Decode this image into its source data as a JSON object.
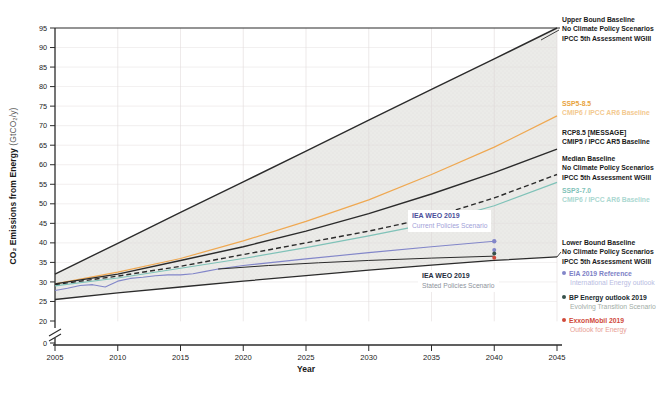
{
  "labels": {
    "ylabel_main": "CO₂ Emissions from Energy ",
    "ylabel_unit": "(GtCO₂/y)",
    "xlabel": "Year"
  },
  "chart_data": {
    "type": "line",
    "title": "",
    "xlabel": "Year",
    "ylabel": "CO2 Emissions from Energy (GtCO2/y)",
    "xlim": [
      2005,
      2045
    ],
    "ylim": [
      20,
      95
    ],
    "axis_break_to_zero": true,
    "x_ticks": [
      2005,
      2010,
      2015,
      2020,
      2025,
      2030,
      2035,
      2040,
      2045
    ],
    "y_ticks": [
      0,
      20,
      25,
      30,
      35,
      40,
      45,
      50,
      55,
      60,
      65,
      70,
      75,
      80,
      85,
      90,
      95
    ],
    "grid": true,
    "shaded_band": {
      "between": [
        "upper-bound-baseline",
        "lower-bound-baseline"
      ],
      "color": "#ebebe8"
    },
    "series": [
      {
        "id": "upper-bound-baseline",
        "color": "#2b2b2b",
        "width": 1.4,
        "x": [
          2005,
          2010,
          2015,
          2020,
          2025,
          2030,
          2035,
          2040,
          2045
        ],
        "values": [
          32,
          39.9,
          47.8,
          55.6,
          63.5,
          71.4,
          79.3,
          87.1,
          95
        ]
      },
      {
        "id": "ssp5-8.5",
        "color": "#efa851",
        "width": 1.2,
        "x": [
          2005,
          2010,
          2015,
          2020,
          2025,
          2030,
          2035,
          2040,
          2045
        ],
        "values": [
          29.5,
          32.5,
          36,
          40.5,
          45.5,
          51,
          57.5,
          64.5,
          72.5
        ]
      },
      {
        "id": "rcp8.5-message",
        "color": "#2b2b2b",
        "width": 1.4,
        "x": [
          2005,
          2010,
          2015,
          2020,
          2025,
          2030,
          2035,
          2040,
          2045
        ],
        "values": [
          29.5,
          32,
          35.5,
          39,
          43,
          47.5,
          52.5,
          58,
          64
        ]
      },
      {
        "id": "median-baseline",
        "color": "#2b2b2b",
        "width": 1.4,
        "dash": "5 3",
        "x": [
          2005,
          2010,
          2015,
          2020,
          2025,
          2030,
          2035,
          2040,
          2045
        ],
        "values": [
          29.3,
          31.5,
          34,
          37,
          40,
          43,
          46.5,
          51.5,
          57.5
        ]
      },
      {
        "id": "ssp3-7.0",
        "color": "#7fc2b8",
        "width": 1.2,
        "x": [
          2005,
          2010,
          2015,
          2020,
          2025,
          2030,
          2035,
          2040,
          2045
        ],
        "values": [
          29,
          31,
          33.5,
          36,
          38.8,
          41.8,
          45,
          49.5,
          55.5
        ]
      },
      {
        "id": "lower-bound-baseline",
        "color": "#2b2b2b",
        "width": 1.3,
        "x": [
          2005,
          2010,
          2015,
          2020,
          2025,
          2030,
          2035,
          2040,
          2045
        ],
        "values": [
          25.5,
          27.2,
          28.7,
          30.2,
          31.6,
          33,
          34.3,
          35.5,
          36.4
        ]
      },
      {
        "id": "iea-weo-2019-current-policies",
        "color": "#8286c9",
        "width": 1.1,
        "end_marker": true,
        "x": [
          2005,
          2006,
          2007,
          2008,
          2009,
          2010,
          2011,
          2012,
          2013,
          2014,
          2015,
          2016,
          2017,
          2018,
          2020,
          2025,
          2030,
          2035,
          2040
        ],
        "values": [
          27.8,
          28.4,
          29.1,
          29.3,
          28.7,
          30.2,
          30.9,
          31.2,
          31.6,
          31.8,
          31.8,
          32.1,
          32.7,
          33.3,
          34.2,
          35.9,
          37.5,
          39,
          40.4
        ]
      },
      {
        "id": "iea-weo-2019-stated-policies",
        "color": "#2b2b2b",
        "width": 1,
        "x": [
          2018,
          2022,
          2026,
          2030,
          2035,
          2040
        ],
        "values": [
          33.3,
          34.2,
          34.9,
          35.5,
          36.1,
          36.6
        ]
      }
    ],
    "point_markers": [
      {
        "id": "eia-2019-reference",
        "x": 2040,
        "value": 38.2,
        "color": "#8286c9"
      },
      {
        "id": "bp-energy-outlook-2019",
        "x": 2040,
        "value": 37.3,
        "color": "#36514a"
      },
      {
        "id": "exxonmobil-2019",
        "x": 2040,
        "value": 36.2,
        "color": "#d0493a"
      }
    ],
    "annotations": [
      {
        "id": "iea-weo-2019-current",
        "title": "IEA WEO 2019",
        "subtitle": "Current Policies Scenario",
        "title_color": "#4a4e9a",
        "subtitle_color": "#9fa2d8"
      },
      {
        "id": "iea-weo-2019-stated",
        "title": "IEA WEO 2019",
        "subtitle": "Stated Policies Scenario",
        "title_color": "#232c3c",
        "subtitle_color": "#8d939c"
      }
    ]
  },
  "legend": {
    "entries": [
      {
        "id": "upper-bound-baseline",
        "bullet": null,
        "lines": [
          {
            "text": "Upper Bound Baseline",
            "color": "#1a1a1a",
            "bold": true
          },
          {
            "text": "No Climate Policy Scenarios",
            "color": "#1a1a1a",
            "bold": true
          },
          {
            "text": "IPCC 5th Assessment WGIII",
            "color": "#1a1a1a",
            "bold": true
          }
        ]
      },
      {
        "id": "ssp5-8.5",
        "bullet": null,
        "lines": [
          {
            "text": "SSP5-8.5",
            "color": "#e8a33d",
            "bold": true
          },
          {
            "text": "CMIP6 / IPCC AR6 Baseline",
            "color": "#f3c98f",
            "bold": true
          }
        ]
      },
      {
        "id": "rcp8.5-message",
        "bullet": null,
        "lines": [
          {
            "text": "RCP8.5 [MESSAGE]",
            "color": "#1a1a1a",
            "bold": true
          },
          {
            "text": "CMIP5 / IPCC AR5 Baseline",
            "color": "#1a1a1a",
            "bold": true
          }
        ]
      },
      {
        "id": "median-baseline",
        "bullet": null,
        "lines": [
          {
            "text": "Median Baseline",
            "color": "#1a1a1a",
            "bold": true
          },
          {
            "text": "No Climate Policy Scenarios",
            "color": "#1a1a1a",
            "bold": true
          },
          {
            "text": "IPCC 5th Assessment WGIII",
            "color": "#1a1a1a",
            "bold": true
          }
        ]
      },
      {
        "id": "ssp3-7.0",
        "bullet": null,
        "lines": [
          {
            "text": "SSP3-7.0",
            "color": "#7fc2b8",
            "bold": true
          },
          {
            "text": "CMIP6 / IPCC AR6 Baseline",
            "color": "#abd8d1",
            "bold": true
          }
        ]
      },
      {
        "id": "lower-bound-baseline",
        "bullet": null,
        "lines": [
          {
            "text": "Lower Bound Baseline",
            "color": "#1a1a1a",
            "bold": true
          },
          {
            "text": "No Climate Policy Scenarios",
            "color": "#1a1a1a",
            "bold": true
          },
          {
            "text": "IPCC 5th Assessment WGIII",
            "color": "#1a1a1a",
            "bold": true
          }
        ]
      },
      {
        "id": "eia-2019-reference",
        "bullet": "#8286c9",
        "lines": [
          {
            "text": "EIA 2019 Reference",
            "color": "#7d81c6",
            "bold": true
          },
          {
            "text": "International Energy outlook",
            "color": "#b9bce2",
            "bold": false
          }
        ]
      },
      {
        "id": "bp-energy-outlook-2019",
        "bullet": "#36514a",
        "lines": [
          {
            "text": "BP Energy outlook 2019",
            "color": "#20292e",
            "bold": true
          },
          {
            "text": "Evolving Transition Scenario",
            "color": "#9fada6",
            "bold": false
          }
        ]
      },
      {
        "id": "exxonmobil-2019",
        "bullet": "#d0493a",
        "lines": [
          {
            "text": "ExxonMobil 2019",
            "color": "#d0493a",
            "bold": true
          },
          {
            "text": "Outlook for Energy",
            "color": "#e8a095",
            "bold": false
          }
        ]
      }
    ]
  }
}
